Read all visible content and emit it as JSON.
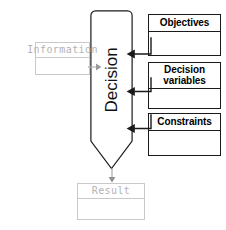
{
  "diagram": {
    "central": {
      "label": "Decision",
      "shape": "down-arrow",
      "outline_color": "#1a1a1a"
    },
    "inputs": [
      {
        "id": "objectives",
        "label": "Objectives",
        "style": "strong",
        "color": "#000000",
        "arrow": "left"
      },
      {
        "id": "decision-variables",
        "label": "Decision variables",
        "style": "strong",
        "color": "#000000",
        "arrow": "left"
      },
      {
        "id": "constraints",
        "label": "Constraints",
        "style": "strong",
        "color": "#000000",
        "arrow": "left"
      }
    ],
    "information": {
      "id": "information",
      "label": "Information",
      "style": "faded",
      "color": "#b3b3b3",
      "arrow": "right"
    },
    "output": {
      "id": "result",
      "label": "Result",
      "style": "faded",
      "color": "#b3b3b3",
      "arrow": "down"
    }
  }
}
